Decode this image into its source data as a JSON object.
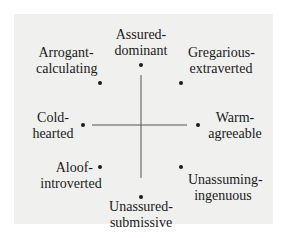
{
  "diagram": {
    "type": "circumplex",
    "background_color": "#f0f0ef",
    "ink_color": "#1a1a1a",
    "axes": {
      "vertical": {
        "from": "Assured-dominant",
        "to": "Unassured-submissive"
      },
      "horizontal": {
        "from": "Cold-hearted",
        "to": "Warm-agreeable"
      }
    },
    "nodes": [
      {
        "id": "assured",
        "line1": "Assured-",
        "line2": "dominant",
        "position": "top"
      },
      {
        "id": "arrogant",
        "line1": "Arrogant-",
        "line2": "calculating",
        "position": "top-left"
      },
      {
        "id": "gregarious",
        "line1": "Gregarious-",
        "line2": "extraverted",
        "position": "top-right"
      },
      {
        "id": "cold",
        "line1": "Cold-",
        "line2": "hearted",
        "position": "left"
      },
      {
        "id": "warm",
        "line1": "Warm-",
        "line2": "agreeable",
        "position": "right"
      },
      {
        "id": "aloof",
        "line1": "Aloof-",
        "line2": "introverted",
        "position": "bottom-left"
      },
      {
        "id": "unassuming",
        "line1": "Unassuming-",
        "line2": "ingenuous",
        "position": "bottom-right"
      },
      {
        "id": "unassured",
        "line1": "Unassured-",
        "line2": "submissive",
        "position": "bottom"
      }
    ]
  }
}
